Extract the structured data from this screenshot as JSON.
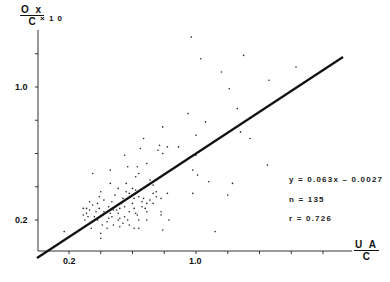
{
  "chart_data": {
    "type": "scatter",
    "title": "",
    "xlabel": {
      "num": "U A",
      "den": "C"
    },
    "ylabel": {
      "num": "O x",
      "den": "C",
      "multiplier": "× 1 0"
    },
    "xlim": [
      0.0,
      2.2
    ],
    "ylim": [
      0.02,
      1.25
    ],
    "x_ticks": [
      0.2,
      0.4,
      0.6,
      0.8,
      1.0,
      1.2,
      1.4,
      1.6,
      1.8
    ],
    "x_tick_labels": [
      {
        "value": 0.2,
        "label": "0.2"
      },
      {
        "value": 1.0,
        "label": "1.0"
      }
    ],
    "y_ticks": [
      0.2,
      0.4,
      0.6,
      0.8,
      1.0,
      1.2
    ],
    "y_tick_labels": [
      {
        "value": 0.2,
        "label": "0.2"
      },
      {
        "value": 1.0,
        "label": "1.0"
      }
    ],
    "grid": false,
    "regression": {
      "x": [
        0.0,
        1.94
      ],
      "y": [
        0.0,
        1.19
      ],
      "color": "#111111"
    },
    "annotations": {
      "equation": "y = 0.063x – 0.0027",
      "n": "n = 135",
      "r": "r = 0.726"
    },
    "points": [
      [
        0.97,
        1.3
      ],
      [
        1.03,
        1.17
      ],
      [
        1.3,
        1.19
      ],
      [
        1.63,
        1.12
      ],
      [
        1.16,
        1.09
      ],
      [
        1.46,
        1.04
      ],
      [
        1.21,
        0.99
      ],
      [
        1.26,
        0.87
      ],
      [
        0.95,
        0.84
      ],
      [
        1.06,
        0.79
      ],
      [
        0.79,
        0.76
      ],
      [
        1.28,
        0.73
      ],
      [
        1.34,
        0.69
      ],
      [
        1.0,
        0.71
      ],
      [
        0.67,
        0.69
      ],
      [
        0.89,
        0.64
      ],
      [
        0.77,
        0.65
      ],
      [
        0.82,
        0.64
      ],
      [
        0.65,
        0.63
      ],
      [
        0.76,
        0.62
      ],
      [
        0.79,
        0.6
      ],
      [
        0.55,
        0.59
      ],
      [
        1.0,
        0.59
      ],
      [
        1.45,
        0.53
      ],
      [
        0.98,
        0.5
      ],
      [
        1.01,
        0.47
      ],
      [
        1.08,
        0.43
      ],
      [
        1.23,
        0.42
      ],
      [
        0.98,
        0.36
      ],
      [
        1.2,
        0.35
      ],
      [
        1.12,
        0.13
      ],
      [
        0.79,
        0.14
      ],
      [
        0.83,
        0.2
      ],
      [
        0.17,
        0.13
      ],
      [
        0.4,
        0.09
      ],
      [
        0.46,
        0.5
      ],
      [
        0.46,
        0.42
      ],
      [
        0.57,
        0.52
      ],
      [
        0.63,
        0.52
      ],
      [
        0.62,
        0.46
      ],
      [
        0.64,
        0.48
      ],
      [
        0.69,
        0.54
      ],
      [
        0.73,
        0.41
      ],
      [
        0.82,
        0.49
      ],
      [
        0.82,
        0.36
      ],
      [
        0.78,
        0.33
      ],
      [
        0.75,
        0.34
      ],
      [
        0.67,
        0.33
      ],
      [
        0.71,
        0.32
      ],
      [
        0.69,
        0.3
      ],
      [
        0.73,
        0.3
      ],
      [
        0.66,
        0.28
      ],
      [
        0.69,
        0.25
      ],
      [
        0.78,
        0.25
      ],
      [
        0.78,
        0.23
      ],
      [
        0.69,
        0.2
      ],
      [
        0.64,
        0.15
      ],
      [
        0.61,
        0.15
      ],
      [
        0.61,
        0.27
      ],
      [
        0.62,
        0.24
      ],
      [
        0.63,
        0.23
      ],
      [
        0.64,
        0.2
      ],
      [
        0.58,
        0.25
      ],
      [
        0.6,
        0.3
      ],
      [
        0.61,
        0.33
      ],
      [
        0.58,
        0.36
      ],
      [
        0.56,
        0.37
      ],
      [
        0.56,
        0.42
      ],
      [
        0.6,
        0.39
      ],
      [
        0.51,
        0.39
      ],
      [
        0.49,
        0.35
      ],
      [
        0.54,
        0.33
      ],
      [
        0.53,
        0.3
      ],
      [
        0.52,
        0.27
      ],
      [
        0.5,
        0.26
      ],
      [
        0.51,
        0.24
      ],
      [
        0.52,
        0.21
      ],
      [
        0.51,
        0.2
      ],
      [
        0.54,
        0.18
      ],
      [
        0.55,
        0.22
      ],
      [
        0.55,
        0.28
      ],
      [
        0.57,
        0.2
      ],
      [
        0.47,
        0.31
      ],
      [
        0.45,
        0.28
      ],
      [
        0.42,
        0.25
      ],
      [
        0.42,
        0.32
      ],
      [
        0.4,
        0.37
      ],
      [
        0.39,
        0.34
      ],
      [
        0.38,
        0.3
      ],
      [
        0.39,
        0.27
      ],
      [
        0.35,
        0.29
      ],
      [
        0.35,
        0.48
      ],
      [
        0.33,
        0.31
      ],
      [
        0.33,
        0.26
      ],
      [
        0.31,
        0.27
      ],
      [
        0.29,
        0.27
      ],
      [
        0.29,
        0.23
      ],
      [
        0.31,
        0.24
      ],
      [
        0.32,
        0.22
      ],
      [
        0.34,
        0.15
      ],
      [
        0.36,
        0.22
      ],
      [
        0.38,
        0.2
      ],
      [
        0.41,
        0.17
      ],
      [
        0.44,
        0.15
      ],
      [
        0.45,
        0.21
      ],
      [
        0.43,
        0.24
      ],
      [
        0.46,
        0.24
      ],
      [
        0.47,
        0.22
      ],
      [
        0.48,
        0.17
      ],
      [
        0.3,
        0.2
      ],
      [
        0.62,
        0.38
      ],
      [
        0.64,
        0.34
      ],
      [
        0.66,
        0.31
      ],
      [
        0.68,
        0.27
      ],
      [
        0.73,
        0.36
      ],
      [
        0.75,
        0.37
      ],
      [
        0.4,
        0.12
      ],
      [
        0.44,
        0.19
      ],
      [
        0.37,
        0.25
      ],
      [
        0.52,
        0.16
      ],
      [
        0.58,
        0.17
      ],
      [
        0.48,
        0.26
      ],
      [
        0.71,
        0.44
      ]
    ]
  }
}
